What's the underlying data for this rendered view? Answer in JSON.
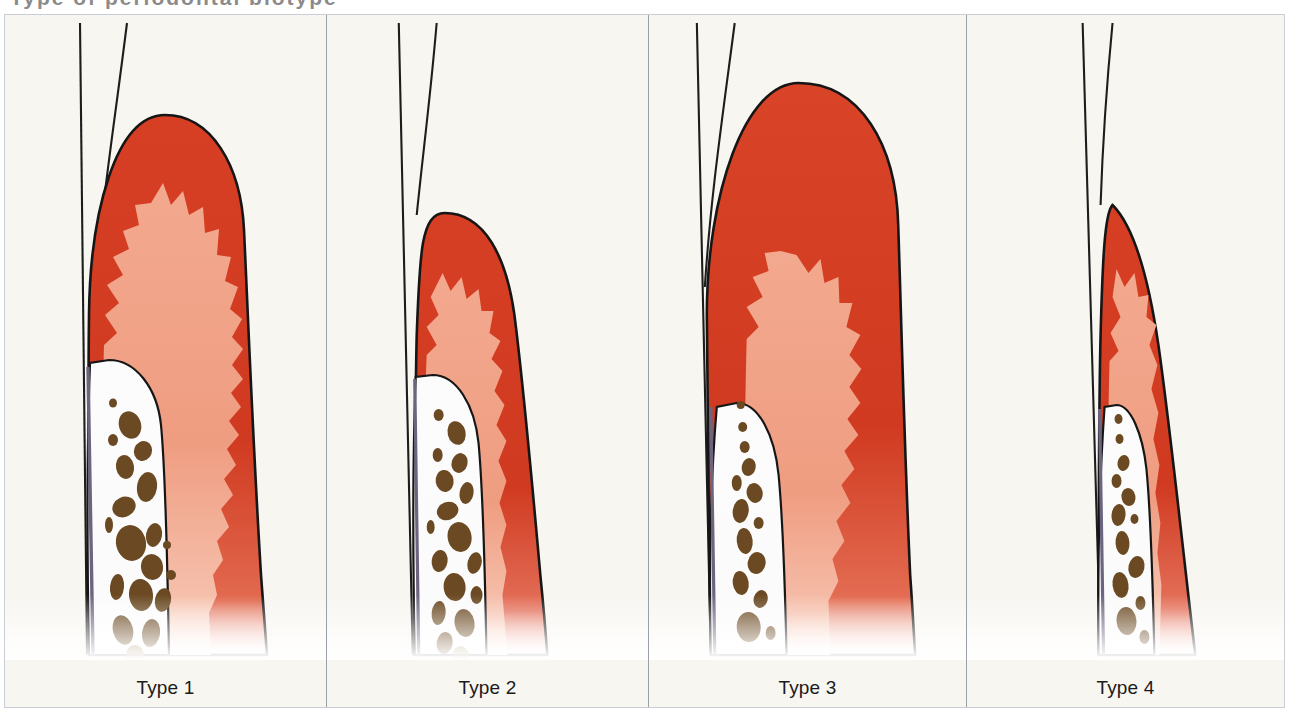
{
  "figure": {
    "kind": "medical-illustration",
    "panel_count": 4,
    "clipped_header_text": "Type of periodontal biotype",
    "background_color": "#f8f6f1",
    "frame_color": "#c9cdd6",
    "divider_color": "#9aa0ab"
  },
  "palette": {
    "gingiva_dark_red": "#d03a20",
    "gingiva_dark_red_deep": "#c33318",
    "gingiva_light_pink": "#ef9d81",
    "gingiva_pink_pale": "#f4b79f",
    "bone_white": "#fbfbfb",
    "bone_speckle": "#e9e9ea",
    "marrow_brown": "#6b4a23",
    "marrow_brown_light": "#8a6a36",
    "root_line_purple": "#6d6480",
    "outline_black": "#161616",
    "crown_line": "#1d1d1d",
    "fade_white": "#ffffff"
  },
  "panels": [
    {
      "id": "type-1",
      "label": "Type 1",
      "tissue_thickness": "thick",
      "papilla_height": "tall",
      "rete_peg_count": 9,
      "bone_width": "wide",
      "description": "Thick flat gingival biotype with tall broad interdental papilla and pronounced rete peg interdigitation"
    },
    {
      "id": "type-2",
      "label": "Type 2",
      "tissue_thickness": "thin",
      "papilla_height": "short",
      "rete_peg_count": 5,
      "bone_width": "medium",
      "description": "Thin scalloped biotype with short narrow papilla and few rete pegs"
    },
    {
      "id": "type-3",
      "label": "Type 3",
      "tissue_thickness": "very-thick",
      "papilla_height": "tall-narrow",
      "rete_peg_count": 9,
      "bone_width": "narrow",
      "description": "Very thick bulky gingiva with long slender papilla buried deep in tissue"
    },
    {
      "id": "type-4",
      "label": "Type 4",
      "tissue_thickness": "very-thin",
      "papilla_height": "short-pointed",
      "rete_peg_count": 4,
      "bone_width": "very-narrow",
      "description": "Very thin highly scalloped biotype with sharp pointed papilla and thin alveolar bone"
    }
  ],
  "anatomy_legend": {
    "crown_contour": "adjacent tooth crown outline",
    "gingiva_epithelium": "keratinized gingival epithelium",
    "connective_tissue": "gingival connective tissue",
    "rete_pegs": "epithelial rete peg interdigitation",
    "alveolar_bone": "alveolar bone crest",
    "marrow_spaces": "trabecular marrow spaces",
    "root_surface": "tooth root surface"
  }
}
